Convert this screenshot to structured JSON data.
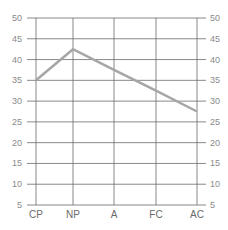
{
  "chart_data": {
    "type": "line",
    "title": "",
    "xlabel": "",
    "ylabel": "",
    "categories": [
      "CP",
      "NP",
      "A",
      "FC",
      "AC"
    ],
    "series": [
      {
        "name": "series-1",
        "values": [
          35,
          42.5,
          37.5,
          32.5,
          27.5
        ],
        "color": "#a6a6a6"
      }
    ],
    "ylim": [
      5,
      50
    ],
    "yticks": [
      5,
      10,
      15,
      20,
      25,
      30,
      35,
      40,
      45,
      50
    ],
    "ytick_labels_left": [
      "5",
      "10",
      "15",
      "20",
      "25",
      "30",
      "35",
      "40",
      "45",
      "50"
    ],
    "ytick_labels_right": [
      "5",
      "10",
      "15",
      "20",
      "25",
      "30",
      "35",
      "40",
      "45",
      "50"
    ],
    "grid": true,
    "legend": "none"
  },
  "colors": {
    "grid": "#6b6b6b",
    "line": "#a6a6a6",
    "tick_text": "#8a8a8a"
  }
}
